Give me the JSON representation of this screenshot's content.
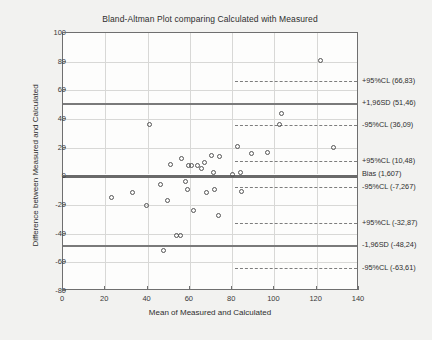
{
  "chart_data": {
    "type": "scatter",
    "title": "Bland-Altman Plot comparing Calculated with Measured",
    "xlabel": "Mean of Measured and Calculated",
    "ylabel": "Difference between Measured and Calculated",
    "xlim": [
      0,
      140
    ],
    "ylim": [
      -80,
      100
    ],
    "xticks": [
      0,
      20,
      40,
      60,
      80,
      100,
      120,
      140
    ],
    "yticks": [
      -80,
      -60,
      -40,
      -20,
      0,
      20,
      40,
      60,
      80,
      100
    ],
    "grid": true,
    "legend": "none",
    "points": [
      {
        "x": 23.0,
        "y": -15.0
      },
      {
        "x": 33.0,
        "y": -11.0
      },
      {
        "x": 41.0,
        "y": 36.0
      },
      {
        "x": 39.5,
        "y": -20.0
      },
      {
        "x": 46.0,
        "y": -5.5
      },
      {
        "x": 47.5,
        "y": -52.0
      },
      {
        "x": 49.5,
        "y": -17.0
      },
      {
        "x": 51.0,
        "y": 8.0
      },
      {
        "x": 53.5,
        "y": -41.5
      },
      {
        "x": 55.5,
        "y": -41.5
      },
      {
        "x": 56.0,
        "y": 12.5
      },
      {
        "x": 58.0,
        "y": -3.5
      },
      {
        "x": 59.5,
        "y": 7.5
      },
      {
        "x": 61.0,
        "y": 7.5
      },
      {
        "x": 59.0,
        "y": -9.0
      },
      {
        "x": 61.5,
        "y": -24.0
      },
      {
        "x": 63.5,
        "y": 7.5
      },
      {
        "x": 65.5,
        "y": 5.5
      },
      {
        "x": 68.0,
        "y": -11.5
      },
      {
        "x": 67.0,
        "y": 10.0
      },
      {
        "x": 70.0,
        "y": 14.5
      },
      {
        "x": 71.0,
        "y": 3.0
      },
      {
        "x": 71.5,
        "y": -9.0
      },
      {
        "x": 74.0,
        "y": 13.5
      },
      {
        "x": 73.5,
        "y": -27.0
      },
      {
        "x": 80.0,
        "y": 1.5
      },
      {
        "x": 82.5,
        "y": 20.5
      },
      {
        "x": 84.0,
        "y": 2.5
      },
      {
        "x": 84.5,
        "y": -10.5
      },
      {
        "x": 89.0,
        "y": 16.0
      },
      {
        "x": 96.5,
        "y": 16.5
      },
      {
        "x": 103.5,
        "y": 44.0
      },
      {
        "x": 102.5,
        "y": 36.5
      },
      {
        "x": 122.0,
        "y": 81.0
      },
      {
        "x": 128.0,
        "y": 20.0
      }
    ],
    "reference_lines": [
      {
        "label": "+95%CL (66,83)",
        "value": 66.83,
        "style": "dashed"
      },
      {
        "label": "+1,96SD (51,46)",
        "value": 51.46,
        "style": "solid"
      },
      {
        "label": "-95%CL (36,09)",
        "value": 36.09,
        "style": "dashed"
      },
      {
        "label": "+95%CL (10,48)",
        "value": 10.48,
        "style": "dashed"
      },
      {
        "label": "Bias (1,607)",
        "value": 1.607,
        "style": "bias"
      },
      {
        "label": "-95%CL (-7,267)",
        "value": -7.267,
        "style": "dashed"
      },
      {
        "label": "+95%CL (-32,87)",
        "value": -32.87,
        "style": "dashed"
      },
      {
        "label": "-1,96SD (-48,24)",
        "value": -48.24,
        "style": "solid"
      },
      {
        "label": "-95%CL (-63,61)",
        "value": -63.61,
        "style": "dashed"
      }
    ]
  }
}
